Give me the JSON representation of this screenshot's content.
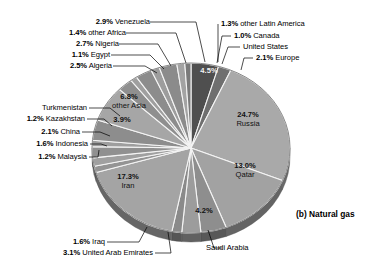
{
  "caption": "(b) Natural gas",
  "chart_data": {
    "type": "pie",
    "title": "(b) Natural gas",
    "subtitle": "",
    "xlabel": "",
    "ylabel": "",
    "units": "percent",
    "legend_position": "none",
    "grid": false,
    "note": "Share of world natural gas reserves by country. Slices ordered clockwise from 12 o'clock.",
    "labels": [
      "United States",
      "Europe",
      "Russia",
      "Qatar",
      "Saudi Arabia",
      "United Arab Emirates",
      "Iraq",
      "Iran",
      "Malaysia",
      "Indonesia",
      "China",
      "Kazakhstan",
      "Turkmenistan",
      "other Asia",
      "Algeria",
      "Egypt",
      "Nigeria",
      "other Africa",
      "Venezuela",
      "other Latin America",
      "Canada"
    ],
    "values": [
      4.5,
      2.1,
      24.7,
      13.0,
      4.2,
      3.1,
      1.6,
      17.3,
      1.2,
      1.6,
      2.1,
      1.2,
      3.9,
      6.8,
      2.5,
      1.1,
      2.7,
      1.4,
      2.9,
      1.3,
      1.0
    ],
    "slices": [
      {
        "name": "United States",
        "value": 4.5,
        "pct_text": "4.5%",
        "label_placement": "inside",
        "color": "#4f4f4f"
      },
      {
        "name": "Europe",
        "value": 2.1,
        "pct_text": "2.1%",
        "label_placement": "outside",
        "color": "#6f6f6f"
      },
      {
        "name": "Russia",
        "value": 24.7,
        "pct_text": "24.7%",
        "label_placement": "inside",
        "color": "#a9a9a9"
      },
      {
        "name": "Qatar",
        "value": 13.0,
        "pct_text": "13.0%",
        "label_placement": "inside",
        "color": "#a2a2a2"
      },
      {
        "name": "Saudi Arabia",
        "value": 4.2,
        "pct_text": "4.2%",
        "label_placement": "inside",
        "color": "#8e8e8e"
      },
      {
        "name": "United Arab Emirates",
        "value": 3.1,
        "pct_text": "3.1%",
        "label_placement": "outside",
        "color": "#9c9c9c"
      },
      {
        "name": "Iraq",
        "value": 1.6,
        "pct_text": "1.6%",
        "label_placement": "outside",
        "color": "#8a8a8a"
      },
      {
        "name": "Iran",
        "value": 17.3,
        "pct_text": "17.3%",
        "label_placement": "inside",
        "color": "#a4a4a4"
      },
      {
        "name": "Malaysia",
        "value": 1.2,
        "pct_text": "1.2%",
        "label_placement": "outside",
        "color": "#949494"
      },
      {
        "name": "Indonesia",
        "value": 1.6,
        "pct_text": "1.6%",
        "label_placement": "outside",
        "color": "#a0a0a0"
      },
      {
        "name": "China",
        "value": 2.1,
        "pct_text": "2.1%",
        "label_placement": "outside",
        "color": "#909090"
      },
      {
        "name": "Kazakhstan",
        "value": 1.2,
        "pct_text": "1.2%",
        "label_placement": "outside",
        "color": "#9e9e9e"
      },
      {
        "name": "Turkmenistan",
        "value": 3.9,
        "pct_text": "3.9%",
        "label_placement": "inside",
        "color": "#8d8d8d"
      },
      {
        "name": "other Asia",
        "value": 6.8,
        "pct_text": "6.8%",
        "label_placement": "inside",
        "color": "#a6a6a6"
      },
      {
        "name": "Algeria",
        "value": 2.5,
        "pct_text": "2.5%",
        "label_placement": "outside",
        "color": "#8f8f8f"
      },
      {
        "name": "Egypt",
        "value": 1.1,
        "pct_text": "1.1%",
        "label_placement": "outside",
        "color": "#9f9f9f"
      },
      {
        "name": "Nigeria",
        "value": 2.7,
        "pct_text": "2.7%",
        "label_placement": "outside",
        "color": "#8c8c8c"
      },
      {
        "name": "other Africa",
        "value": 1.4,
        "pct_text": "1.4%",
        "label_placement": "outside",
        "color": "#9d9d9d"
      },
      {
        "name": "Venezuela",
        "value": 2.9,
        "pct_text": "2.9%",
        "label_placement": "outside",
        "color": "#8b8b8b"
      },
      {
        "name": "other Latin America",
        "value": 1.3,
        "pct_text": "1.3%",
        "label_placement": "outside",
        "color": "#a3a3a3"
      },
      {
        "name": "Canada",
        "value": 1.0,
        "pct_text": "1.0%",
        "label_placement": "outside",
        "color": "#7a7a7a"
      }
    ]
  },
  "callouts": {
    "venezuela": {
      "pct": "2.9%",
      "name": "Venezuela"
    },
    "other_africa": {
      "pct": "1.4%",
      "name": "other Africa"
    },
    "nigeria": {
      "pct": "2.7%",
      "name": "Nigeria"
    },
    "egypt": {
      "pct": "1.1%",
      "name": "Egypt"
    },
    "algeria": {
      "pct": "2.5%",
      "name": "Algeria"
    },
    "other_latin": {
      "pct": "1.3%",
      "name": "other Latin America"
    },
    "canada": {
      "pct": "1.0%",
      "name": "Canada"
    },
    "united_states": {
      "pct": "",
      "name": "United States"
    },
    "europe": {
      "pct": "2.1%",
      "name": "Europe"
    },
    "turkmenistan": {
      "pct": "",
      "name": "Turkmenistan"
    },
    "kazakhstan": {
      "pct": "1.2%",
      "name": "Kazakhstan"
    },
    "china": {
      "pct": "2.1%",
      "name": "China"
    },
    "indonesia": {
      "pct": "1.6%",
      "name": "Indonesia"
    },
    "malaysia": {
      "pct": "1.2%",
      "name": "Malaysia"
    },
    "iraq": {
      "pct": "1.6%",
      "name": "Iraq"
    },
    "uae": {
      "pct": "3.1%",
      "name": "United Arab Emirates"
    },
    "saudi": {
      "pct": "",
      "name": "Saudi Arabia"
    }
  },
  "inside_labels": {
    "us_pct": "4.5%",
    "russia_pct": "24.7%",
    "russia_name": "Russia",
    "qatar_pct": "13.0%",
    "qatar_name": "Qatar",
    "saudi_pct": "4.2%",
    "iran_pct": "17.3%",
    "iran_name": "Iran",
    "other_asia_pct": "6.8%",
    "other_asia_name": "other Asia",
    "turkmenistan_pct": "3.9%"
  }
}
